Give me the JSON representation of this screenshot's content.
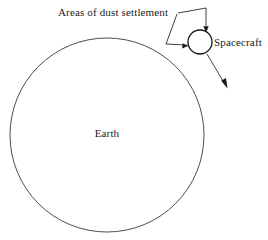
{
  "figure": {
    "type": "schematic-diagram",
    "background_color": "#ffffff",
    "stroke_color": "#2a2a2a",
    "text_color": "#1a1a1a",
    "width": 268,
    "height": 240
  },
  "labels": {
    "dust_settlement": "Areas of dust settlement",
    "spacecraft": "Spacecraft",
    "earth": "Earth"
  },
  "shapes": {
    "earth": {
      "name": "Earth",
      "center_x": 107,
      "center_y": 135,
      "radius": 97
    },
    "spacecraft": {
      "name": "Spacecraft",
      "center_x": 200,
      "center_y": 42,
      "radius": 12
    }
  },
  "annotations": {
    "leader_top": {
      "label": "Areas of dust settlement",
      "path": "M178,13 L206,8 L206,29",
      "target": "spacecraft-top"
    },
    "leader_left": {
      "label": "Areas of dust settlement",
      "path": "M177,14 L166,44 L185,45",
      "target": "spacecraft-left"
    },
    "trajectory_arrow": {
      "path": "M207,54 L226,86",
      "target": "trajectory-direction"
    }
  }
}
